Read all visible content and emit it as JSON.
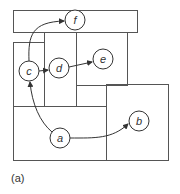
{
  "caption": "(a)",
  "colors": {
    "stroke": "#555555",
    "text": "#333333",
    "background": "#ffffff"
  },
  "nodes": [
    {
      "id": "f",
      "label": "f",
      "cx": 75,
      "cy": 20,
      "r": 10
    },
    {
      "id": "c",
      "label": "c",
      "cx": 29,
      "cy": 71,
      "r": 10
    },
    {
      "id": "d",
      "label": "d",
      "cx": 59,
      "cy": 68,
      "r": 10
    },
    {
      "id": "e",
      "label": "e",
      "cx": 103,
      "cy": 59,
      "r": 10
    },
    {
      "id": "a",
      "label": "a",
      "cx": 60,
      "cy": 138,
      "r": 10
    },
    {
      "id": "b",
      "label": "b",
      "cx": 139,
      "cy": 121,
      "r": 10
    }
  ],
  "edges": [
    {
      "from": "c",
      "to": "f"
    },
    {
      "from": "c",
      "to": "d"
    },
    {
      "from": "d",
      "to": "e"
    },
    {
      "from": "a",
      "to": "c"
    },
    {
      "from": "a",
      "to": "b"
    }
  ],
  "regions": [
    {
      "name": "top-region",
      "x": 13,
      "y": 10,
      "w": 124,
      "h": 22
    },
    {
      "name": "left-region",
      "x": 13,
      "y": 42,
      "w": 31,
      "h": 64
    },
    {
      "name": "middle-region",
      "x": 44,
      "y": 32,
      "w": 32,
      "h": 74
    },
    {
      "name": "right-upper-region",
      "x": 76,
      "y": 32,
      "w": 51,
      "h": 53
    },
    {
      "name": "bottom-left-region",
      "x": 13,
      "y": 106,
      "w": 93,
      "h": 54
    },
    {
      "name": "bottom-right-region",
      "x": 106,
      "y": 84,
      "w": 62,
      "h": 76
    }
  ]
}
